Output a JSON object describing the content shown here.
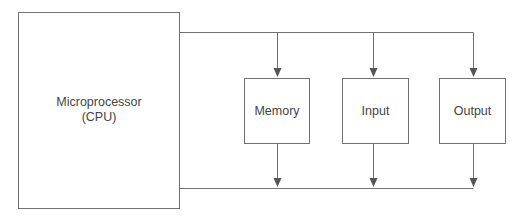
{
  "diagram": {
    "type": "block-diagram",
    "title": "",
    "nodes": [
      {
        "id": "cpu",
        "label_line1": "Microprocessor",
        "label_line2": "(CPU)"
      },
      {
        "id": "memory",
        "label": "Memory"
      },
      {
        "id": "input",
        "label": "Input"
      },
      {
        "id": "output",
        "label": "Output"
      }
    ],
    "edges": [
      {
        "from": "cpu",
        "to": "memory",
        "via": "top-bus"
      },
      {
        "from": "cpu",
        "to": "input",
        "via": "top-bus"
      },
      {
        "from": "cpu",
        "to": "output",
        "via": "top-bus"
      },
      {
        "from": "memory",
        "to": "cpu",
        "via": "bottom-bus"
      },
      {
        "from": "input",
        "to": "cpu",
        "via": "bottom-bus"
      },
      {
        "from": "output",
        "to": "cpu",
        "via": "bottom-bus"
      }
    ],
    "colors": {
      "line": "#6e6e6e",
      "box_border": "#7a7a7a",
      "text": "#444444",
      "background": "#ffffff"
    }
  }
}
